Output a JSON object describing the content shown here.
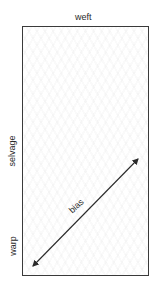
{
  "diagram": {
    "labels": {
      "top": "weft",
      "side": "selvage",
      "side_lower": "warp",
      "diagonal": "bias"
    },
    "fabric": {
      "border_color": "#3a3a3a",
      "fill_color": "#ffffff"
    },
    "arrow": {
      "type": "double-headed",
      "direction": "diagonal",
      "from": [
        32,
        267
      ],
      "to": [
        139,
        158
      ],
      "color": "#2a2a2a"
    }
  }
}
